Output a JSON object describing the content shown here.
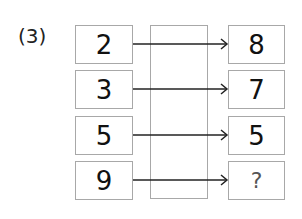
{
  "problem": {
    "label": "(3)",
    "rows": [
      {
        "input": "2",
        "output": "8"
      },
      {
        "input": "3",
        "output": "7"
      },
      {
        "input": "5",
        "output": "5"
      },
      {
        "input": "9",
        "output": "?"
      }
    ],
    "colors": {
      "box_border": "#a8a8a8",
      "arrow": "#222222",
      "text": "#111111"
    }
  }
}
